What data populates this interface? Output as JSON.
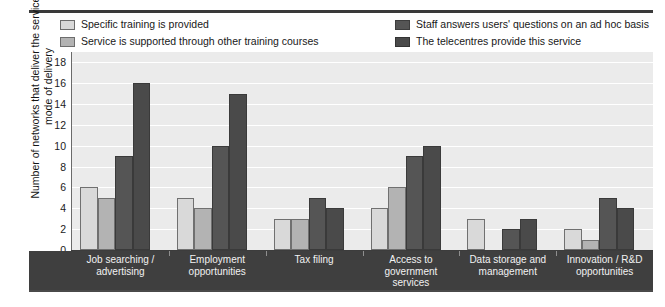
{
  "chart_data": {
    "type": "bar",
    "title": "",
    "xlabel": "",
    "ylabel": "Number of networks that deliver the services,\nby mode of delivery",
    "ylim": [
      0,
      19
    ],
    "yticks": [
      0,
      2,
      4,
      6,
      8,
      10,
      12,
      14,
      16,
      18
    ],
    "ytick_labels": [
      "0",
      "2",
      "4",
      "6",
      "8",
      "10",
      "12",
      "14",
      "16",
      "18"
    ],
    "grid": true,
    "legend_position": "top",
    "categories": [
      "Job searching /\nadvertising",
      "Employment\nopportunities",
      "Tax filing",
      "Access to\ngovernment\nservices",
      "Data storage and\nmanagement",
      "Innovation / R&D\nopportunities"
    ],
    "series": [
      {
        "name": "Specific training is provided",
        "color": "#d9d9d9",
        "values": [
          6,
          5,
          3,
          4,
          3,
          2
        ]
      },
      {
        "name": "Service is supported through other training courses",
        "color": "#b3b3b3",
        "values": [
          5,
          4,
          3,
          6,
          0,
          1
        ]
      },
      {
        "name": "Staff answers users' questions on an ad hoc basis",
        "color": "#555555",
        "values": [
          9,
          10,
          5,
          9,
          2,
          5
        ]
      },
      {
        "name": "The telecentres provide this service",
        "color": "#4a4a4a",
        "values": [
          16,
          15,
          4,
          10,
          3,
          4
        ]
      }
    ]
  },
  "colors": {
    "plot_background": "#ebebeb",
    "axis_band": "#3f3f3f",
    "gridline": "#ffffff",
    "text": "#181818",
    "axis_band_text": "#f2f2f2"
  }
}
